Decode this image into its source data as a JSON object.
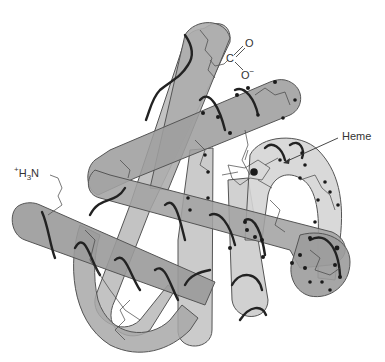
{
  "figure": {
    "labels": {
      "n_terminus": {
        "charge": "+",
        "text": "H",
        "sub": "3",
        "text2": "N"
      },
      "c_terminus": {
        "c": "C",
        "o_top": "O",
        "o_bottom": "O",
        "charge": "−"
      },
      "heme": "Heme"
    },
    "colors": {
      "tube_dark": "#9a9a9a",
      "tube_mid": "#b3b3b3",
      "tube_light": "#cfcfcf",
      "tube_outline": "#555555",
      "helix_line": "#222222",
      "sidechain_line": "#555555",
      "atom_dot": "#1a1a1a",
      "background": "#ffffff"
    }
  }
}
